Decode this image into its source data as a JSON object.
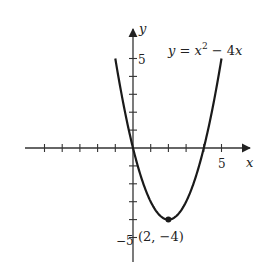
{
  "chart_data": {
    "type": "line",
    "title": "",
    "equation": {
      "lhs": "y",
      "eq": " = ",
      "var": "x",
      "exp": "2",
      "rest": " − 4",
      "rest_var": "x"
    },
    "xlabel": "x",
    "ylabel": "y",
    "xlim": [
      -6,
      6.5
    ],
    "ylim": [
      -6,
      6.5
    ],
    "x_tick_labels": [
      {
        "value": 5,
        "label": "5"
      }
    ],
    "y_tick_labels": [
      {
        "value": 5,
        "label": "5"
      },
      {
        "value": -5,
        "label": "−5"
      }
    ],
    "x_ticks": [
      -5,
      -4,
      -3,
      -2,
      -1,
      1,
      2,
      3,
      4,
      5
    ],
    "y_ticks": [
      -5,
      -4,
      -3,
      -2,
      -1,
      1,
      2,
      3,
      4,
      5
    ],
    "series": [
      {
        "name": "y = x^2 - 4x",
        "function": "x^2 - 4x",
        "x_range": [
          -1,
          5
        ],
        "x": [
          -1,
          0,
          1,
          2,
          3,
          4,
          5
        ],
        "y": [
          5,
          0,
          -3,
          -4,
          -3,
          0,
          5
        ]
      }
    ],
    "annotations": [
      {
        "point": [
          2,
          -4
        ],
        "label": "(2, −4)",
        "marker": "dot"
      }
    ],
    "grid": false,
    "legend": "none"
  }
}
